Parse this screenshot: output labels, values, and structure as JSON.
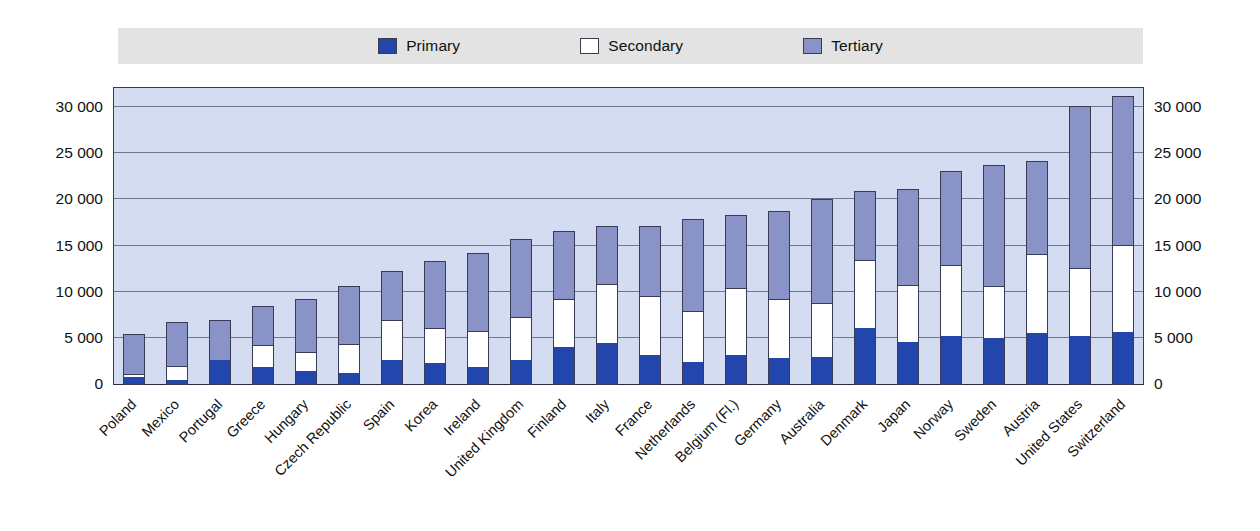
{
  "legend": {
    "items": [
      {
        "label": "Primary",
        "color": "#2346ac",
        "icon": "square-swatch-icon"
      },
      {
        "label": "Secondary",
        "color": "#ffffff",
        "icon": "square-swatch-icon"
      },
      {
        "label": "Tertiary",
        "color": "#8a93c8",
        "icon": "square-swatch-icon"
      }
    ]
  },
  "axis": {
    "y_ticks": [
      "0",
      "5 000",
      "10 000",
      "15 000",
      "20 000",
      "25 000",
      "30 000"
    ],
    "y_tick_values": [
      0,
      5000,
      10000,
      15000,
      20000,
      25000,
      30000
    ],
    "y_min": 0,
    "y_max": 32300
  },
  "chart_data": {
    "type": "bar",
    "subtype": "stacked-vertical",
    "title": "",
    "subtitle": "",
    "xlabel": "",
    "ylabel": "",
    "ylim": [
      0,
      32300
    ],
    "grid": true,
    "legend_position": "top",
    "categories": [
      "Poland",
      "Mexico",
      "Portugal",
      "Greece",
      "Hungary",
      "Czech Republic",
      "Spain",
      "Korea",
      "Ireland",
      "United Kingdom",
      "Finland",
      "Italy",
      "France",
      "Netherlands",
      "Belgium (Fl.)",
      "Germany",
      "Australia",
      "Denmark",
      "Japan",
      "Norway",
      "Sweden",
      "Austria",
      "United States",
      "Switzerland"
    ],
    "series": [
      {
        "name": "Primary",
        "color": "#2346ac",
        "values": [
          900,
          550,
          2700,
          1900,
          1500,
          1300,
          2700,
          2400,
          2000,
          2700,
          4100,
          4600,
          3200,
          2500,
          3200,
          2900,
          3000,
          6200,
          4700,
          5300,
          5100,
          5600,
          5300,
          5800
        ]
      },
      {
        "name": "Secondary",
        "color": "#ffffff",
        "values": [
          300,
          1550,
          0,
          2400,
          2100,
          3100,
          4300,
          3800,
          3900,
          4700,
          5200,
          6400,
          6500,
          5500,
          7300,
          6400,
          5900,
          7400,
          6100,
          7700,
          5600,
          8600,
          7400,
          9400
        ]
      },
      {
        "name": "Tertiary",
        "color": "#8a93c8",
        "values": [
          4300,
          4700,
          4400,
          4300,
          5700,
          6300,
          5400,
          7200,
          8400,
          8400,
          7400,
          6200,
          7500,
          10000,
          7900,
          9600,
          11300,
          7400,
          10400,
          10200,
          13100,
          10100,
          17500,
          16100
        ]
      }
    ],
    "totals": [
      5500,
      6800,
      7100,
      8600,
      9300,
      10700,
      12400,
      13400,
      14300,
      15800,
      16700,
      17200,
      17200,
      18000,
      18400,
      18900,
      20200,
      21000,
      21200,
      23200,
      23800,
      24300,
      30200,
      31300
    ]
  }
}
